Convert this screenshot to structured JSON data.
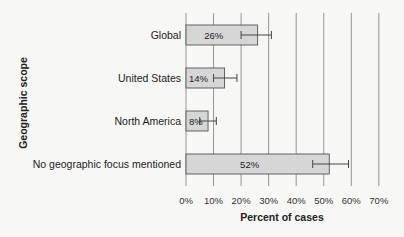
{
  "chart_data": {
    "type": "bar",
    "orientation": "horizontal",
    "title": "",
    "xlabel": "Percent of cases",
    "ylabel": "Geographic scope",
    "xlim": [
      0,
      70
    ],
    "x_ticks": [
      0,
      10,
      20,
      30,
      40,
      50,
      60,
      70
    ],
    "x_tick_labels": [
      "0%",
      "10%",
      "20%",
      "30%",
      "40%",
      "50%",
      "60%",
      "70%"
    ],
    "grid": "vertical",
    "categories": [
      "Global",
      "United States",
      "North America",
      "No geographic focus mentioned"
    ],
    "values": [
      26,
      14,
      8,
      52
    ],
    "value_labels": [
      "26%",
      "14%",
      "8%",
      "52%"
    ],
    "error_bars": [
      {
        "low": 20,
        "high": 31
      },
      {
        "low": 10,
        "high": 18.5
      },
      {
        "low": 5,
        "high": 11
      },
      {
        "low": 46,
        "high": 59
      }
    ],
    "colors": {
      "bar_fill": "#d6d6d6",
      "bar_stroke": "#555555",
      "grid": "#8a8a8a"
    }
  }
}
